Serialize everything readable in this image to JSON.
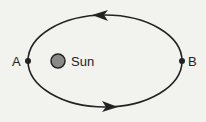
{
  "diagram": {
    "title": "",
    "labels": {
      "point_a": "A",
      "point_b": "B",
      "sun": "Sun"
    },
    "colors": {
      "background": "#f2f2ef",
      "orbit": "#222222",
      "sun_fill": "#8a8a8a"
    }
  }
}
